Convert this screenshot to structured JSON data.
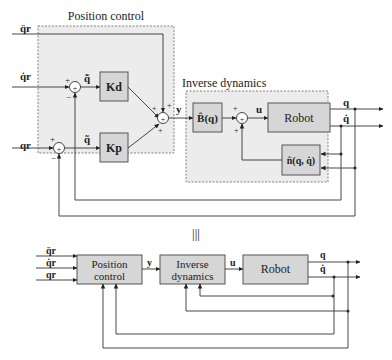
{
  "top": {
    "position_control_title": "Position control",
    "inverse_dynamics_title": "Inverse dynamics",
    "inputs": {
      "qddot_r": "q̈r",
      "qdot_r": "q̇r",
      "q_r": "qr"
    },
    "error_labels": {
      "qdot_tilde": "q̃̇",
      "q_tilde": "q̃"
    },
    "gain_kd": "Kd",
    "gain_kp": "Kp",
    "signal_y": "y",
    "signal_u": "u",
    "block_B": "B̂(q)",
    "block_n": "n̂(q, q̇)",
    "block_robot": "Robot",
    "output_q": "q",
    "output_qdot": "q̇",
    "signs": {
      "plus": "+",
      "minus": "−"
    }
  },
  "equiv_symbol": "|||",
  "bottom": {
    "inputs": [
      "q̈r",
      "q̇r",
      "qr"
    ],
    "position_control": [
      "Position",
      "control"
    ],
    "inverse_dynamics": [
      "Inverse",
      "dynamics"
    ],
    "robot": "Robot",
    "signal_y": "y",
    "signal_u": "u",
    "output_q": "q",
    "output_qdot": "q̇"
  }
}
